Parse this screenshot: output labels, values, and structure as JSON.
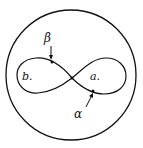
{
  "diagram": {
    "labels": {
      "region_left": "b.",
      "region_right": "a.",
      "arrow_top": "β",
      "arrow_bottom": "α"
    },
    "colors": {
      "stroke": "#111111",
      "background": "#ffffff"
    }
  }
}
